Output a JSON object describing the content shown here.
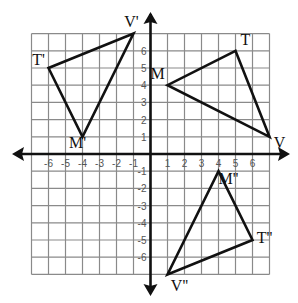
{
  "chart_data": {
    "type": "scatter",
    "title": "",
    "xlabel": "",
    "ylabel": "",
    "xlim": [
      -7,
      7
    ],
    "ylim": [
      -7,
      7
    ],
    "grid": true,
    "x_ticks": [
      -6,
      -5,
      -4,
      -3,
      -2,
      -1,
      1,
      2,
      3,
      4,
      5,
      6
    ],
    "y_ticks": [
      -6,
      -5,
      -4,
      -3,
      -2,
      -1,
      1,
      2,
      3,
      4,
      5,
      6
    ],
    "x_tick_labels": [
      "-6",
      "-5",
      "-4",
      "-3",
      "-2",
      "-1",
      "1",
      "2",
      "3",
      "4",
      "5",
      "6"
    ],
    "y_tick_labels": [
      "-6",
      "-5",
      "-4",
      "-3",
      "-2",
      "-1",
      "1",
      "2",
      "3",
      "4",
      "5",
      "6"
    ],
    "series": [
      {
        "name": "Triangle MTV",
        "vertices": [
          {
            "label": "T",
            "x": 5,
            "y": 6
          },
          {
            "label": "M",
            "x": 1,
            "y": 4
          },
          {
            "label": "V",
            "x": 7,
            "y": 1
          }
        ]
      },
      {
        "name": "Triangle M'T'V'",
        "vertices": [
          {
            "label": "T'",
            "x": -6,
            "y": 5
          },
          {
            "label": "M'",
            "x": -4,
            "y": 1
          },
          {
            "label": "V'",
            "x": -1,
            "y": 7
          }
        ]
      },
      {
        "name": "Triangle M''T''V''",
        "vertices": [
          {
            "label": "M''",
            "x": 4,
            "y": -1
          },
          {
            "label": "T''",
            "x": 6,
            "y": -5
          },
          {
            "label": "V''",
            "x": 1,
            "y": -7
          }
        ]
      }
    ]
  },
  "colors": {
    "grid": "#8a8a8a",
    "axis": "#111111",
    "triangle": "#111111",
    "background": "#ffffff"
  }
}
